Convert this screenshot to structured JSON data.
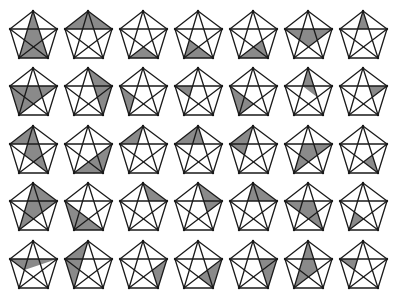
{
  "shade_color": "#8a8a8a",
  "line_color": "#1a1a1a",
  "vertex_legend": {
    "A": "top",
    "B": "right",
    "C": "bottom-right",
    "D": "bottom-left",
    "E": "left"
  },
  "inner_points": [
    "AC^BE",
    "AD^BE",
    "AC^BD",
    "AD^CE",
    "BD^CE"
  ],
  "rows": [
    [
      [
        "A",
        "C",
        "D"
      ],
      [
        "A",
        "E",
        "B"
      ],
      [
        "D",
        "C",
        "BD^CE"
      ],
      [
        "D",
        "C",
        "AD^CE"
      ],
      [
        "D",
        "C",
        "AC^BD"
      ],
      [
        "E",
        "B",
        "BD^CE"
      ],
      [
        "A",
        "AD^BE",
        "AC^BE"
      ]
    ],
    [
      [
        "E",
        "B",
        "D"
      ],
      [
        "A",
        "B",
        "C"
      ],
      [
        "E",
        "D",
        "AD^CE"
      ],
      [
        "E",
        "AD^BE",
        "AD^CE"
      ],
      [
        "E",
        "D",
        "BD^CE"
      ],
      [
        "A",
        "AD^BE",
        "AC^BD",
        "C"
      ],
      [
        "B",
        "AC^BE",
        "AC^BD"
      ]
    ],
    [
      [
        "A",
        "E",
        "AD^BE",
        "AD^CE",
        "C"
      ],
      [
        "B",
        "C",
        "D"
      ],
      [
        "A",
        "E",
        "AD^BE"
      ],
      [
        "A",
        "E",
        "AC^BE"
      ],
      [
        "A",
        "E",
        "AD^CE"
      ],
      [
        "AD^BE",
        "B",
        "D"
      ],
      [
        "AC^BD",
        "C",
        "BD^CE"
      ]
    ],
    [
      [
        "A",
        "B",
        "D"
      ],
      [
        "E",
        "D",
        "C"
      ],
      [
        "A",
        "AC^BE",
        "B"
      ],
      [
        "A",
        "B",
        "AC^BD"
      ],
      [
        "A",
        "B",
        "AC^BE",
        "AD^BE"
      ],
      [
        "E",
        "AC^BE",
        "C"
      ],
      [
        "D",
        "AD^CE",
        "BD^CE"
      ]
    ],
    [
      [
        "E",
        "B",
        "AD^CE"
      ],
      [
        "A",
        "E",
        "D"
      ],
      [
        "B",
        "C",
        "AC^BD"
      ],
      [
        "B",
        "BD^CE",
        "C"
      ],
      [
        "B",
        "AC^BE",
        "C"
      ],
      [
        "A",
        "D",
        "AC^BD"
      ],
      [
        "E",
        "AD^BE",
        "AD^CE"
      ]
    ]
  ]
}
